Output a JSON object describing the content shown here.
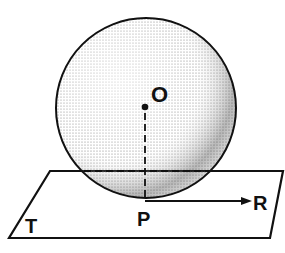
{
  "diagram": {
    "type": "geometry",
    "labels": {
      "center": "O",
      "tangent_point": "P",
      "ray_end": "R",
      "plane": "T"
    },
    "colors": {
      "stroke": "#111111",
      "shade": "#555555",
      "background": "#ffffff"
    }
  }
}
